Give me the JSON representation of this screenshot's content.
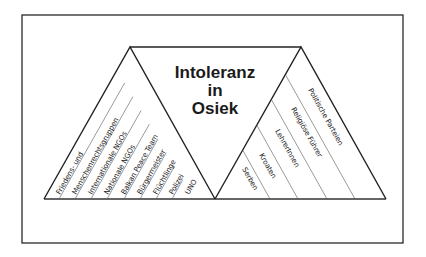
{
  "diagram": {
    "title_lines": [
      "Intoleranz",
      "in",
      "Osiek"
    ],
    "left_triangle": {
      "labels": [
        "Friedens- und",
        "Menschenrechtsgruppen",
        "Internationale NGOs",
        "Nationale NGOs",
        "Balkan Peace Team",
        "Bürgermeister",
        "Flüchtlinge",
        "Polizei",
        "UNO"
      ]
    },
    "right_triangle": {
      "labels": [
        "Serben",
        "Kroaten",
        "LehrerInnen",
        "Religiöse Führer",
        "Politische Parteien"
      ]
    },
    "colors": {
      "stroke": "#222222",
      "background": "#ffffff"
    }
  }
}
